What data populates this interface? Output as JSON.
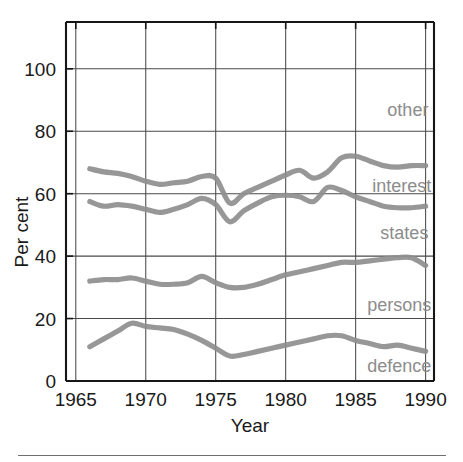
{
  "figure": {
    "title_fragment": "",
    "background": "#ffffff",
    "line_color": "#8e8e8e",
    "label_color": "#8c8c8c",
    "axis_color": "#161616",
    "grid_color": "#4a4a4a"
  },
  "axes": {
    "y": {
      "title": "Per cent",
      "ticks": [
        0,
        20,
        40,
        60,
        80,
        100
      ],
      "tick_labels": [
        "0",
        "20",
        "40",
        "60",
        "80",
        "100"
      ],
      "min": 0,
      "max": 115
    },
    "x": {
      "title": "Year",
      "ticks": [
        1965,
        1970,
        1975,
        1980,
        1985,
        1990
      ],
      "tick_labels": [
        "1965",
        "1970",
        "1975",
        "1980",
        "1985",
        "1990"
      ],
      "min": 1964.3,
      "max": 1990.6
    }
  },
  "series_labels": [
    {
      "name": "other",
      "value_y": 85,
      "value_x": 1990.2
    },
    {
      "name": "interest",
      "value_y": 60.5,
      "value_x": 1990.4
    },
    {
      "name": "states",
      "value_y": 45.5,
      "value_x": 1990.2
    },
    {
      "name": "persons",
      "value_y": 22.5,
      "value_x": 1990.4
    },
    {
      "name": "defence",
      "value_y": 3.0,
      "value_x": 1990.4
    }
  ],
  "chart_data": {
    "type": "line",
    "title": "",
    "xlabel": "Year",
    "ylabel": "Per cent",
    "xlim": [
      1964.3,
      1990.6
    ],
    "ylim": [
      0,
      115
    ],
    "grid": true,
    "legend_position": "inline-right",
    "x": [
      1966,
      1967,
      1968,
      1969,
      1970,
      1971,
      1972,
      1973,
      1974,
      1975,
      1976,
      1977,
      1978,
      1979,
      1980,
      1981,
      1982,
      1983,
      1984,
      1985,
      1986,
      1987,
      1988,
      1989,
      1990
    ],
    "series": [
      {
        "name": "other",
        "values": [
          68.0,
          67.0,
          66.5,
          65.5,
          64.0,
          63.0,
          63.5,
          64.0,
          65.5,
          65.0,
          57.0,
          60.0,
          62.0,
          64.0,
          66.0,
          67.5,
          65.0,
          67.0,
          71.5,
          72.0,
          70.5,
          69.0,
          68.5,
          69.0,
          69.0
        ]
      },
      {
        "name": "interest",
        "values": [
          57.5,
          56.0,
          56.5,
          56.0,
          55.0,
          54.0,
          55.0,
          56.5,
          58.5,
          56.5,
          51.0,
          54.5,
          57.0,
          59.0,
          59.5,
          59.0,
          57.5,
          62.0,
          61.0,
          59.0,
          57.5,
          56.0,
          55.5,
          55.5,
          56.0
        ]
      },
      {
        "name": "states",
        "values": [
          32.0,
          32.5,
          32.5,
          33.0,
          32.0,
          31.0,
          31.0,
          31.5,
          33.5,
          31.5,
          30.0,
          30.0,
          31.0,
          32.5,
          34.0,
          35.0,
          36.0,
          37.0,
          38.0,
          38.0,
          38.5,
          39.0,
          39.5,
          39.5,
          37.0
        ]
      },
      {
        "name": "defence",
        "values": [
          11.0,
          13.5,
          16.0,
          18.5,
          17.5,
          17.0,
          16.5,
          15.0,
          13.0,
          10.5,
          8.0,
          8.5,
          9.5,
          10.5,
          11.5,
          12.5,
          13.5,
          14.5,
          14.5,
          13.0,
          12.0,
          11.0,
          11.5,
          10.5,
          9.5
        ]
      }
    ]
  }
}
